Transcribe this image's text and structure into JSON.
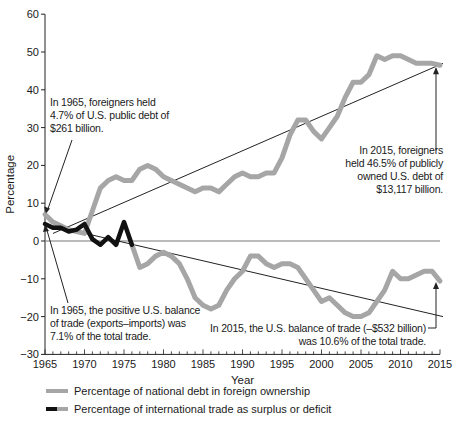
{
  "chart_data": {
    "type": "line",
    "title": "",
    "xlabel": "Year",
    "ylabel": "Percentage",
    "ylim": [
      -30,
      60
    ],
    "xlim": [
      1965,
      2015
    ],
    "y_ticks": [
      60,
      50,
      40,
      30,
      20,
      10,
      0,
      -10,
      -20,
      -30
    ],
    "x_ticks": [
      1965,
      1970,
      1975,
      1980,
      1985,
      1990,
      1995,
      2000,
      2005,
      2010,
      2015
    ],
    "grid": false,
    "legend_position": "bottom",
    "x": [
      1965,
      1966,
      1967,
      1968,
      1969,
      1970,
      1971,
      1972,
      1973,
      1974,
      1975,
      1976,
      1977,
      1978,
      1979,
      1980,
      1981,
      1982,
      1983,
      1984,
      1985,
      1986,
      1987,
      1988,
      1989,
      1990,
      1991,
      1992,
      1993,
      1994,
      1995,
      1996,
      1997,
      1998,
      1999,
      2000,
      2001,
      2002,
      2003,
      2004,
      2005,
      2006,
      2007,
      2008,
      2009,
      2010,
      2011,
      2012,
      2013,
      2014,
      2015
    ],
    "series": [
      {
        "name": "Percentage of national debt in foreign ownership",
        "color": "#a6a6a6",
        "values": [
          7,
          5,
          4,
          3,
          2.5,
          2,
          8,
          14,
          16,
          17,
          16,
          16,
          19,
          20,
          19,
          17,
          16,
          15,
          14,
          13,
          14,
          14,
          13,
          15,
          17,
          18,
          17,
          17,
          18,
          18,
          22,
          28,
          32,
          32,
          29,
          27,
          30,
          33,
          38,
          42,
          42,
          44,
          49,
          48,
          49,
          49,
          48,
          47,
          47,
          47,
          46.5
        ]
      },
      {
        "name": "Percentage of international trade as surplus or deficit",
        "color": "#a6a6a6",
        "early_color": "#111111",
        "early_until": 1976,
        "values": [
          4.5,
          3.5,
          3.5,
          2.5,
          3,
          4.5,
          0.5,
          -1,
          1,
          -1,
          5,
          -1,
          -7,
          -6,
          -4,
          -3,
          -4,
          -6,
          -10,
          -15,
          -17,
          -18,
          -17,
          -13,
          -10,
          -8,
          -4,
          -4,
          -6,
          -7,
          -6,
          -6,
          -7,
          -10,
          -13,
          -16,
          -15,
          -17,
          -19,
          -20,
          -20,
          -19,
          -16,
          -13,
          -8,
          -10,
          -10,
          -9,
          -8,
          -8,
          -10.6
        ]
      }
    ],
    "trend_lines": [
      {
        "name": "debt trend",
        "from": [
          1966,
          2
        ],
        "to": [
          2015,
          47
        ]
      },
      {
        "name": "trade trend",
        "from": [
          1966,
          4
        ],
        "to": [
          2015,
          -20
        ]
      }
    ],
    "annotations": [
      {
        "text": "In 1965, foreigners held 4.7% of U.S. public debt of $261 billion.",
        "points_to": [
          1965,
          7
        ]
      },
      {
        "text": "In 1965, the positive U.S. balance of trade (exports–imports) was 7.1% of the total trade.",
        "points_to": [
          1965,
          4.5
        ]
      },
      {
        "text": "In 2015, foreigners held 46.5% of publicly owned U.S. debt of $13,117 billion.",
        "points_to": [
          2015,
          46.5
        ]
      },
      {
        "text": "In 2015, the U.S. balance of trade (–$532 billion) was 10.6% of the total trade.",
        "points_to": [
          2015,
          -10.6
        ]
      }
    ]
  },
  "labels": {
    "ylabel": "Percentage",
    "xlabel": "Year",
    "ann1": [
      "In 1965, foreigners held",
      "4.7% of U.S. public debt of",
      "$261 billion."
    ],
    "ann2": [
      "In 1965, the positive U.S. balance",
      "of trade (exports–imports) was",
      "7.1% of the total trade."
    ],
    "ann3": [
      "In 2015, foreigners",
      "held 46.5% of publicly",
      "owned U.S. debt of",
      "$13,117 billion."
    ],
    "ann4": [
      "In 2015, the U.S. balance of trade (–$532 billion)",
      "was 10.6% of the total trade."
    ],
    "legend": [
      "Percentage of national debt in foreign ownership",
      "Percentage of international trade as surplus or deficit"
    ]
  }
}
